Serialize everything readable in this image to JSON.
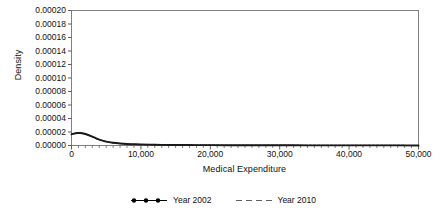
{
  "chart_data": {
    "type": "line",
    "title": "",
    "xlabel": "Medical Expenditure",
    "ylabel": "Density",
    "xlim": [
      0,
      50000
    ],
    "ylim": [
      0,
      0.0002
    ],
    "grid": false,
    "legend_position": "bottom",
    "x_ticks": [
      0,
      10000,
      20000,
      30000,
      40000,
      50000
    ],
    "x_tick_labels": [
      "0",
      "10,000",
      "20,000",
      "30,000",
      "40,000",
      "50,000"
    ],
    "x_minor_tick_step": 1000,
    "y_ticks": [
      0.0,
      2e-05,
      4e-05,
      6e-05,
      8e-05,
      0.0001,
      0.00012,
      0.00014,
      0.00016,
      0.00018,
      0.0002
    ],
    "y_tick_labels": [
      "0.00000",
      "0.00002",
      "0.00004",
      "0.00006",
      "0.00008",
      "0.00010",
      "0.00012",
      "0.00014",
      "0.00016",
      "0.00018",
      "0.00020"
    ],
    "x": [
      0,
      300,
      600,
      900,
      1200,
      1500,
      2000,
      2500,
      3000,
      3500,
      4000,
      5000,
      6000,
      7000,
      8000,
      9000,
      10000,
      12000,
      14000,
      16000,
      18000,
      20000,
      24000,
      28000,
      32000,
      36000,
      40000,
      45000,
      50000
    ],
    "series": [
      {
        "name": "Year 2002",
        "style": "dotted-marker",
        "color": "#000000",
        "values": [
          1.65e-05,
          1.76e-05,
          1.82e-05,
          1.85e-05,
          1.85e-05,
          1.82e-05,
          1.7e-05,
          1.52e-05,
          1.3e-05,
          1.08e-05,
          8.8e-06,
          5.8e-06,
          4e-06,
          2.9e-06,
          2.2e-06,
          1.8e-06,
          1.5e-06,
          1.1e-06,
          8.5e-07,
          7e-07,
          6e-07,
          5.2e-07,
          4e-07,
          3.2e-07,
          2.6e-07,
          2.1e-07,
          1.7e-07,
          1.3e-07,
          1e-07
        ]
      },
      {
        "name": "Year 2010",
        "style": "dashed",
        "color": "#000000",
        "values": [
          1.63e-05,
          1.74e-05,
          1.8e-05,
          1.84e-05,
          1.84e-05,
          1.81e-05,
          1.69e-05,
          1.51e-05,
          1.29e-05,
          1.07e-05,
          8.7e-06,
          5.7e-06,
          3.9e-06,
          2.9e-06,
          2.2e-06,
          1.8e-06,
          1.5e-06,
          1.1e-06,
          8.5e-07,
          7e-07,
          6e-07,
          5.2e-07,
          4e-07,
          3.2e-07,
          2.6e-07,
          2.1e-07,
          1.7e-07,
          1.3e-07,
          1e-07
        ]
      }
    ],
    "peak": {
      "x": 1100,
      "y": 1.85e-05
    }
  },
  "axis": {
    "y_title": "Density",
    "x_title": "Medical Expenditure"
  },
  "legend": {
    "entries": [
      {
        "label": "Year 2002",
        "marker": "dotted-line-marker"
      },
      {
        "label": "Year 2010",
        "marker": "dashed-line-marker"
      }
    ]
  },
  "style": {
    "frame_color": "#808080",
    "line_color": "#1a1a1a",
    "text_color": "#111111",
    "background": "#ffffff"
  }
}
